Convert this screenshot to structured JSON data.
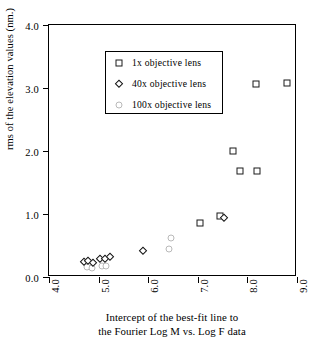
{
  "chart_data": {
    "type": "scatter",
    "title": "",
    "xlabel": "Intercept of the best-fit line to the Fourier Log M vs. Log F data",
    "xlabel_line1": "Intercept of the best-fit line to",
    "xlabel_line2": "the Fourier Log M vs. Log F data",
    "ylabel": "rms of the elevation values (nm.)",
    "xlim": [
      4.0,
      9.0
    ],
    "ylim": [
      0.0,
      4.0
    ],
    "xticks": [
      "4.0",
      "5.0",
      "6.0",
      "7.0",
      "8.0",
      "9.0"
    ],
    "xtick_values": [
      4.0,
      5.0,
      6.0,
      7.0,
      8.0,
      9.0
    ],
    "yticks": [
      "0.0",
      "1.0",
      "2.0",
      "3.0",
      "4.0"
    ],
    "ytick_values": [
      0.0,
      1.0,
      2.0,
      3.0,
      4.0
    ],
    "grid": false,
    "legend_position": "upper left",
    "series": [
      {
        "name": "1x objective lens",
        "marker": "square",
        "color": "#1a1a1a",
        "points": [
          [
            7.05,
            0.86
          ],
          [
            7.45,
            0.97
          ],
          [
            7.7,
            2.0
          ],
          [
            7.85,
            1.68
          ],
          [
            8.2,
            1.68
          ],
          [
            8.18,
            3.06
          ],
          [
            8.8,
            3.08
          ]
        ]
      },
      {
        "name": "40x objective lens",
        "marker": "diamond",
        "color": "#111111",
        "points": [
          [
            4.7,
            0.24
          ],
          [
            4.78,
            0.26
          ],
          [
            4.88,
            0.22
          ],
          [
            5.02,
            0.28
          ],
          [
            5.12,
            0.29
          ],
          [
            5.22,
            0.32
          ],
          [
            5.9,
            0.42
          ],
          [
            7.52,
            0.94
          ]
        ]
      },
      {
        "name": "100x objective lens",
        "marker": "circle",
        "color": "#b9b9b9",
        "points": [
          [
            4.76,
            0.16
          ],
          [
            4.86,
            0.15
          ],
          [
            5.06,
            0.17
          ],
          [
            5.14,
            0.18
          ],
          [
            6.45,
            0.62
          ],
          [
            6.42,
            0.44
          ]
        ]
      }
    ]
  },
  "legend": {
    "items": [
      {
        "label": "1x objective lens",
        "marker": "square"
      },
      {
        "label": "40x objective lens",
        "marker": "diamond"
      },
      {
        "label": "100x objective lens",
        "marker": "circle"
      }
    ]
  }
}
